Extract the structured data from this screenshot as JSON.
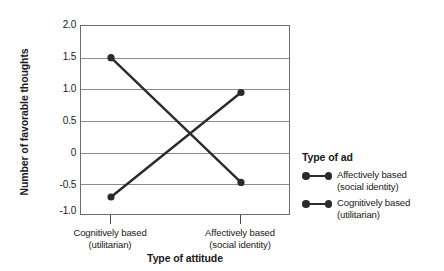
{
  "chart_data": {
    "type": "line",
    "title": "",
    "xlabel": "Type of attitude",
    "ylabel": "Number of favorable thoughts",
    "categories": [
      "Cognitively based\n(utilitarian)",
      "Affectively based\n(social identity)"
    ],
    "category_labels": [
      {
        "line1": "Cognitively based",
        "line2": "(utilitarian)"
      },
      {
        "line1": "Affectively based",
        "line2": "(social identity)"
      }
    ],
    "series": [
      {
        "name": "Affectively based (social identity)",
        "values": [
          -0.7,
          0.95
        ]
      },
      {
        "name": "Cognitively based (utilitarian)",
        "values": [
          1.5,
          -0.47
        ]
      }
    ],
    "ylim": [
      -1.0,
      2.0
    ],
    "yticks": [
      "2.0",
      "1.5",
      "1.0",
      "0.5",
      "0",
      "-0.5",
      "-1.0"
    ],
    "ytick_values": [
      2.0,
      1.5,
      1.0,
      0.5,
      0,
      -0.5,
      -1.0
    ],
    "grid": true,
    "legend_position": "right",
    "line_color": "#2b2b2b",
    "grid_color": "#8c8c8c",
    "axis_color": "#6e6e6e"
  },
  "legend": {
    "title": "Type of ad",
    "items": [
      {
        "line1": "Affectively based",
        "line2": "(social identity)"
      },
      {
        "line1": "Cognitively based",
        "line2": "(utilitarian)"
      }
    ]
  }
}
